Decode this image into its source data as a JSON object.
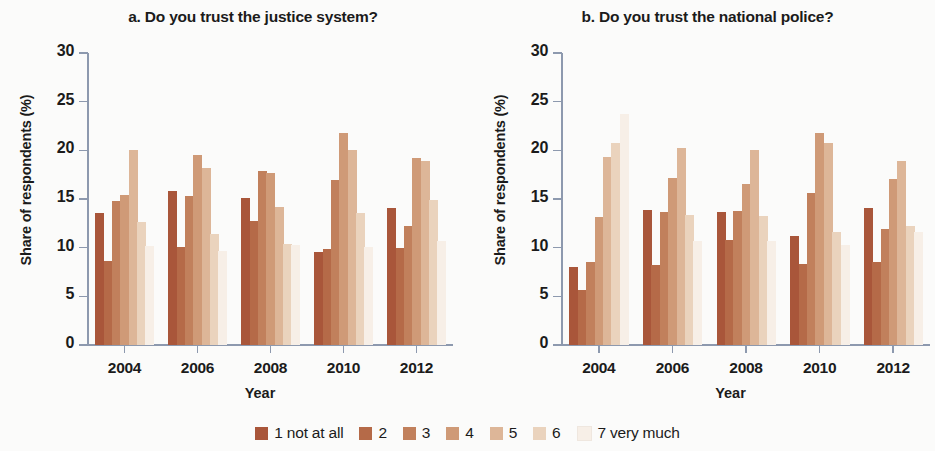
{
  "figure": {
    "xlabel": "Year",
    "ylabel": "Share of respondents (%)"
  },
  "legend": {
    "items": [
      {
        "label": "1 not at all",
        "color": "#a9563a"
      },
      {
        "label": "2",
        "color": "#b56a48"
      },
      {
        "label": "3",
        "color": "#c1805c"
      },
      {
        "label": "4",
        "color": "#cf9a77"
      },
      {
        "label": "5",
        "color": "#ddb698"
      },
      {
        "label": "6",
        "color": "#ead3bd"
      },
      {
        "label": "7 very much",
        "color": "#f7efe7"
      }
    ]
  },
  "chart_data": [
    {
      "type": "bar",
      "panel": "a",
      "title": "a. Do you trust the justice system?",
      "xlabel": "Year",
      "ylabel": "Share of respondents (%)",
      "ylim": [
        0,
        30
      ],
      "yticks": [
        0,
        5,
        10,
        15,
        20,
        25,
        30
      ],
      "grid": false,
      "legend_position": "bottom",
      "categories": [
        "2004",
        "2006",
        "2008",
        "2010",
        "2012"
      ],
      "series": [
        {
          "name": "1 not at all",
          "color": "#a9563a",
          "values": [
            13.6,
            15.8,
            15.1,
            9.6,
            14.1
          ]
        },
        {
          "name": "2",
          "color": "#b56a48",
          "values": [
            8.6,
            10.1,
            12.7,
            9.9,
            10.0
          ]
        },
        {
          "name": "3",
          "color": "#c1805c",
          "values": [
            14.8,
            15.3,
            17.9,
            17.0,
            12.2
          ]
        },
        {
          "name": "4",
          "color": "#cf9a77",
          "values": [
            15.4,
            19.5,
            17.7,
            21.8,
            19.2
          ]
        },
        {
          "name": "5",
          "color": "#ddb698",
          "values": [
            20.0,
            18.2,
            14.2,
            20.0,
            18.9
          ]
        },
        {
          "name": "6",
          "color": "#ead3bd",
          "values": [
            12.6,
            11.4,
            10.4,
            13.6,
            14.9
          ]
        },
        {
          "name": "7 very much",
          "color": "#f7efe7",
          "values": [
            10.2,
            9.7,
            10.3,
            10.1,
            10.7
          ]
        }
      ]
    },
    {
      "type": "bar",
      "panel": "b",
      "title": "b. Do you trust the national police?",
      "xlabel": "Year",
      "ylabel": "Share of respondents (%)",
      "ylim": [
        0,
        30
      ],
      "yticks": [
        0,
        5,
        10,
        15,
        20,
        25,
        30
      ],
      "grid": false,
      "legend_position": "bottom",
      "categories": [
        "2004",
        "2006",
        "2008",
        "2010",
        "2012"
      ],
      "series": [
        {
          "name": "1 not at all",
          "color": "#a9563a",
          "values": [
            8.0,
            13.9,
            13.7,
            11.2,
            14.1
          ]
        },
        {
          "name": "2",
          "color": "#b56a48",
          "values": [
            5.7,
            8.2,
            10.8,
            8.3,
            8.5
          ]
        },
        {
          "name": "3",
          "color": "#c1805c",
          "values": [
            8.5,
            13.7,
            13.8,
            15.6,
            11.9
          ]
        },
        {
          "name": "4",
          "color": "#cf9a77",
          "values": [
            13.2,
            17.2,
            16.5,
            21.8,
            17.1
          ]
        },
        {
          "name": "5",
          "color": "#ddb698",
          "values": [
            19.3,
            20.2,
            20.0,
            20.8,
            18.9
          ]
        },
        {
          "name": "6",
          "color": "#ead3bd",
          "values": [
            20.8,
            13.4,
            13.3,
            11.6,
            12.2
          ]
        },
        {
          "name": "7 very much",
          "color": "#f7efe7",
          "values": [
            23.7,
            10.7,
            10.7,
            10.3,
            11.6
          ]
        }
      ]
    }
  ]
}
